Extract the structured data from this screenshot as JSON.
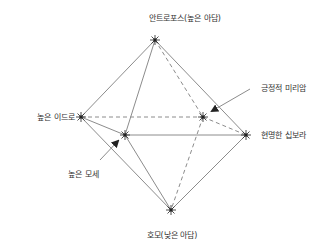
{
  "diagram": {
    "type": "octahedron",
    "colors": {
      "line": "#8c8c8c",
      "text": "#333333",
      "vertex": "#222222",
      "arrow": "#222222"
    },
    "vertices": {
      "top": {
        "x": 155,
        "y": 40
      },
      "left": {
        "x": 81,
        "y": 117
      },
      "front": {
        "x": 125,
        "y": 135
      },
      "back": {
        "x": 203,
        "y": 117
      },
      "right": {
        "x": 246,
        "y": 135
      },
      "bottom": {
        "x": 171,
        "y": 210
      }
    },
    "labels": {
      "top": "안트로포스(높은 아담)",
      "left": "높은 이드로",
      "right": "현명한 십보라",
      "back_callout": "긍정적 미리암",
      "front_callout": "높은 모세",
      "bottom": "호모(낮은 아담)"
    }
  }
}
